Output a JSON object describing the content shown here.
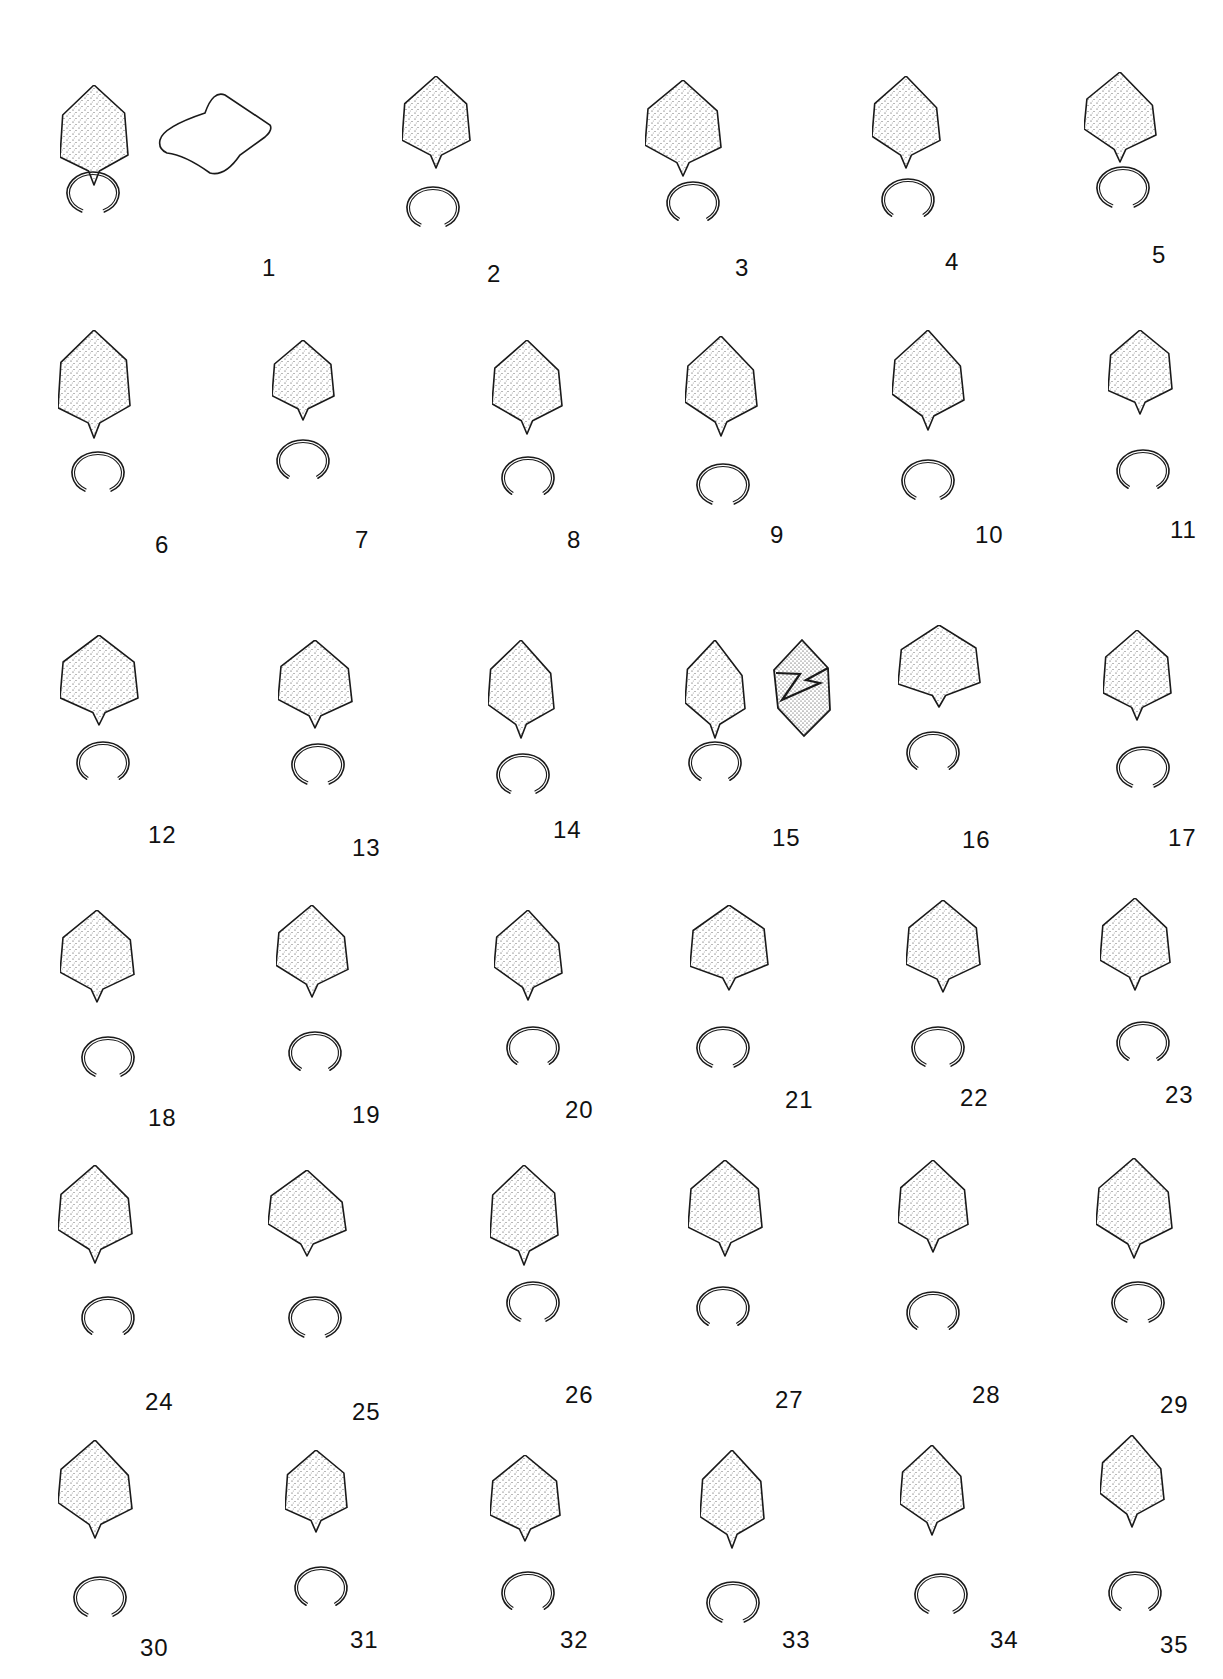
{
  "plate": {
    "description": "Plate of stippled specimen drawings (outline views) with ring/cross-section views, numbered 1-35",
    "ink_color": "#1a1a1a",
    "background": "#ffffff"
  },
  "specimens": [
    {
      "n": "1",
      "x": 60,
      "y": 85,
      "w": 68,
      "h": 100,
      "ring": [
        90,
        190
      ],
      "label": [
        262,
        268
      ],
      "extra_outline": true
    },
    {
      "n": "2",
      "x": 402,
      "y": 76,
      "w": 68,
      "h": 92,
      "ring": [
        430,
        205
      ],
      "label": [
        487,
        274
      ]
    },
    {
      "n": "3",
      "x": 645,
      "y": 80,
      "w": 76,
      "h": 96,
      "ring": [
        690,
        200
      ],
      "label": [
        735,
        268
      ]
    },
    {
      "n": "4",
      "x": 872,
      "y": 76,
      "w": 68,
      "h": 92,
      "ring": [
        905,
        197
      ],
      "label": [
        945,
        262
      ]
    },
    {
      "n": "5",
      "x": 1084,
      "y": 72,
      "w": 72,
      "h": 90,
      "ring": [
        1120,
        185
      ],
      "label": [
        1152,
        255
      ]
    },
    {
      "n": "6",
      "x": 58,
      "y": 330,
      "w": 72,
      "h": 108,
      "ring": [
        95,
        470
      ],
      "label": [
        155,
        545
      ]
    },
    {
      "n": "7",
      "x": 272,
      "y": 340,
      "w": 62,
      "h": 80,
      "ring": [
        300,
        458
      ],
      "label": [
        355,
        540
      ]
    },
    {
      "n": "8",
      "x": 492,
      "y": 340,
      "w": 70,
      "h": 94,
      "ring": [
        525,
        475
      ],
      "label": [
        567,
        540
      ]
    },
    {
      "n": "9",
      "x": 685,
      "y": 336,
      "w": 72,
      "h": 100,
      "ring": [
        720,
        482
      ],
      "label": [
        770,
        535
      ]
    },
    {
      "n": "10",
      "x": 892,
      "y": 330,
      "w": 72,
      "h": 100,
      "ring": [
        925,
        478
      ],
      "label": [
        975,
        535
      ]
    },
    {
      "n": "11",
      "x": 1108,
      "y": 330,
      "w": 64,
      "h": 84,
      "ring": [
        1140,
        468
      ],
      "label": [
        1170,
        530
      ]
    },
    {
      "n": "12",
      "x": 60,
      "y": 635,
      "w": 78,
      "h": 90,
      "ring": [
        100,
        760
      ],
      "label": [
        148,
        835
      ]
    },
    {
      "n": "13",
      "x": 278,
      "y": 640,
      "w": 74,
      "h": 88,
      "ring": [
        315,
        762
      ],
      "label": [
        352,
        848
      ]
    },
    {
      "n": "14",
      "x": 488,
      "y": 640,
      "w": 66,
      "h": 98,
      "ring": [
        520,
        772
      ],
      "label": [
        553,
        830
      ]
    },
    {
      "n": "15",
      "x": 685,
      "y": 640,
      "w": 60,
      "h": 98,
      "ring": [
        712,
        760
      ],
      "label": [
        772,
        838
      ],
      "twin": true
    },
    {
      "n": "16",
      "x": 898,
      "y": 625,
      "w": 82,
      "h": 82,
      "ring": [
        930,
        750
      ],
      "label": [
        962,
        840
      ]
    },
    {
      "n": "17",
      "x": 1103,
      "y": 630,
      "w": 68,
      "h": 90,
      "ring": [
        1140,
        765
      ],
      "label": [
        1168,
        838
      ]
    },
    {
      "n": "18",
      "x": 60,
      "y": 910,
      "w": 74,
      "h": 92,
      "ring": [
        105,
        1055
      ],
      "label": [
        148,
        1118
      ]
    },
    {
      "n": "19",
      "x": 276,
      "y": 905,
      "w": 72,
      "h": 92,
      "ring": [
        312,
        1050
      ],
      "label": [
        352,
        1115
      ]
    },
    {
      "n": "20",
      "x": 494,
      "y": 910,
      "w": 68,
      "h": 90,
      "ring": [
        530,
        1045
      ],
      "label": [
        565,
        1110
      ]
    },
    {
      "n": "21",
      "x": 690,
      "y": 905,
      "w": 78,
      "h": 85,
      "ring": [
        720,
        1045
      ],
      "label": [
        785,
        1100
      ]
    },
    {
      "n": "22",
      "x": 906,
      "y": 900,
      "w": 74,
      "h": 92,
      "ring": [
        935,
        1045
      ],
      "label": [
        960,
        1098
      ]
    },
    {
      "n": "23",
      "x": 1100,
      "y": 898,
      "w": 70,
      "h": 92,
      "ring": [
        1140,
        1040
      ],
      "label": [
        1165,
        1095
      ]
    },
    {
      "n": "24",
      "x": 58,
      "y": 1165,
      "w": 74,
      "h": 98,
      "ring": [
        105,
        1315
      ],
      "label": [
        145,
        1402
      ]
    },
    {
      "n": "25",
      "x": 268,
      "y": 1170,
      "w": 78,
      "h": 86,
      "ring": [
        312,
        1315
      ],
      "label": [
        352,
        1412
      ]
    },
    {
      "n": "26",
      "x": 490,
      "y": 1165,
      "w": 68,
      "h": 100,
      "ring": [
        530,
        1300
      ],
      "label": [
        565,
        1395
      ]
    },
    {
      "n": "27",
      "x": 688,
      "y": 1160,
      "w": 74,
      "h": 96,
      "ring": [
        720,
        1305
      ],
      "label": [
        775,
        1400
      ]
    },
    {
      "n": "28",
      "x": 898,
      "y": 1160,
      "w": 70,
      "h": 92,
      "ring": [
        930,
        1310
      ],
      "label": [
        972,
        1395
      ]
    },
    {
      "n": "29",
      "x": 1096,
      "y": 1158,
      "w": 76,
      "h": 100,
      "ring": [
        1135,
        1300
      ],
      "label": [
        1160,
        1405
      ]
    },
    {
      "n": "30",
      "x": 58,
      "y": 1440,
      "w": 74,
      "h": 98,
      "ring": [
        97,
        1595
      ],
      "label": [
        140,
        1648
      ]
    },
    {
      "n": "31",
      "x": 285,
      "y": 1450,
      "w": 62,
      "h": 82,
      "ring": [
        318,
        1585
      ],
      "label": [
        350,
        1640
      ]
    },
    {
      "n": "32",
      "x": 490,
      "y": 1455,
      "w": 70,
      "h": 86,
      "ring": [
        525,
        1590
      ],
      "label": [
        560,
        1640
      ]
    },
    {
      "n": "33",
      "x": 700,
      "y": 1450,
      "w": 64,
      "h": 98,
      "ring": [
        730,
        1600
      ],
      "label": [
        782,
        1640
      ]
    },
    {
      "n": "34",
      "x": 900,
      "y": 1445,
      "w": 64,
      "h": 90,
      "ring": [
        938,
        1592
      ],
      "label": [
        990,
        1640
      ]
    },
    {
      "n": "35",
      "x": 1100,
      "y": 1435,
      "w": 64,
      "h": 92,
      "ring": [
        1132,
        1590
      ],
      "label": [
        1160,
        1645
      ]
    }
  ]
}
